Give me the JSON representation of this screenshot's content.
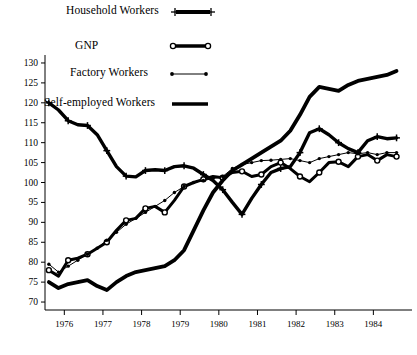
{
  "chart_data": {
    "type": "line",
    "title": "",
    "subtitle": "",
    "xlabel": "",
    "ylabel": "",
    "xlim": [
      1975.5,
      1985.0
    ],
    "ylim": [
      68,
      132
    ],
    "yticks": [
      70,
      75,
      80,
      85,
      90,
      95,
      100,
      105,
      110,
      115,
      120,
      125,
      130
    ],
    "xticks": [
      1976,
      1977,
      1978,
      1979,
      1980,
      1981,
      1982,
      1983,
      1984
    ],
    "xticklabels": [
      "1976",
      "1977",
      "1978",
      "1979",
      "1980",
      "1981",
      "1982",
      "1983",
      "1984"
    ],
    "grid": false,
    "legend_position": "upper-left",
    "x": [
      1975.6,
      1975.85,
      1976.1,
      1976.35,
      1976.6,
      1976.85,
      1977.1,
      1977.35,
      1977.6,
      1977.85,
      1978.1,
      1978.35,
      1978.6,
      1978.85,
      1979.1,
      1979.35,
      1979.6,
      1979.85,
      1980.1,
      1980.35,
      1980.6,
      1980.85,
      1981.1,
      1981.35,
      1981.6,
      1981.85,
      1982.1,
      1982.35,
      1982.6,
      1982.85,
      1983.1,
      1983.35,
      1983.6,
      1983.85,
      1984.1,
      1984.35,
      1984.6
    ],
    "series": [
      {
        "name": "Household Workers",
        "style": "thick-plus",
        "marker": "plus",
        "values": [
          120.0,
          118.2,
          115.5,
          114.5,
          114.3,
          112.0,
          108.0,
          104.0,
          101.6,
          101.4,
          103.0,
          103.2,
          103.0,
          104.0,
          104.2,
          103.6,
          102.0,
          100.5,
          98.2,
          95.0,
          92.0,
          96.0,
          99.5,
          102.5,
          103.5,
          104.0,
          107.5,
          112.5,
          113.5,
          112.0,
          110.0,
          108.5,
          107.5,
          110.5,
          111.5,
          111.0,
          111.2
        ]
      },
      {
        "name": "GNP",
        "style": "thick-open-circle",
        "marker": "open-circle",
        "values": [
          78.0,
          76.5,
          80.5,
          81.0,
          82.0,
          83.5,
          85.0,
          88.0,
          90.5,
          91.0,
          93.5,
          94.0,
          92.5,
          95.5,
          99.0,
          100.0,
          100.8,
          101.5,
          101.2,
          102.5,
          102.8,
          101.5,
          102.0,
          104.0,
          105.0,
          103.5,
          101.5,
          100.2,
          102.5,
          105.0,
          105.2,
          104.0,
          106.5,
          107.0,
          105.5,
          107.0,
          106.5
        ]
      },
      {
        "name": "Factory Workers",
        "style": "thin-dot",
        "marker": "dot",
        "values": [
          79.5,
          77.5,
          79.0,
          80.5,
          82.0,
          83.5,
          85.5,
          87.5,
          89.5,
          91.0,
          92.5,
          94.0,
          95.5,
          97.5,
          99.0,
          100.0,
          100.5,
          101.0,
          101.5,
          103.5,
          104.5,
          105.0,
          105.5,
          105.6,
          105.8,
          106.0,
          105.5,
          105.0,
          106.0,
          106.5,
          107.0,
          107.5,
          107.2,
          107.5,
          107.0,
          107.5,
          107.5
        ]
      },
      {
        "name": "Self-employed Workers",
        "style": "thick-plain",
        "marker": "none",
        "values": [
          75.0,
          73.5,
          74.5,
          75.0,
          75.5,
          74.0,
          73.0,
          75.0,
          76.5,
          77.5,
          78.0,
          78.5,
          79.0,
          80.5,
          83.0,
          88.0,
          93.0,
          97.5,
          100.5,
          103.0,
          104.5,
          106.0,
          107.5,
          109.0,
          110.5,
          113.0,
          117.0,
          121.5,
          124.0,
          123.5,
          123.0,
          124.5,
          125.5,
          126.0,
          126.5,
          127.0,
          128.0
        ]
      }
    ]
  },
  "legend": {
    "items": [
      {
        "label": "Household Workers",
        "style": "thick-plus"
      },
      {
        "label": "GNP",
        "style": "thick-open-circle"
      },
      {
        "label": "Factory Workers",
        "style": "thin-dot"
      },
      {
        "label": "Self-employed Workers",
        "style": "thick-plain"
      }
    ]
  },
  "axes": {
    "ytick_labels": [
      "130",
      "125",
      "120",
      "115",
      "110",
      "105",
      "100",
      "95",
      "90",
      "85",
      "80",
      "75",
      "70"
    ],
    "xtick_labels": [
      "1976",
      "1977",
      "1978",
      "1979",
      "1980",
      "1981",
      "1982",
      "1983",
      "1984"
    ]
  }
}
